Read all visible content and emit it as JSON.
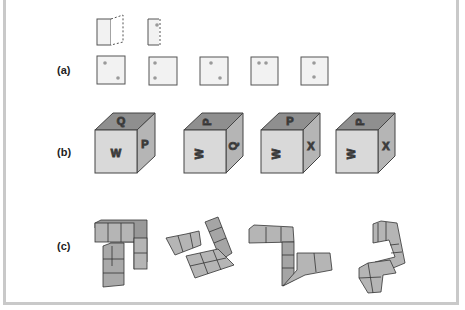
{
  "figure": {
    "rows": [
      {
        "label": "(a)",
        "description": "Unfolding flap and five squares with dot patterns"
      },
      {
        "label": "(b)",
        "description": "Four labeled cubes"
      },
      {
        "label": "(c)",
        "description": "Four unit-cube assemblies"
      }
    ],
    "row_a": {
      "fold_items": [
        "folded-flap",
        "half-square-with-dot"
      ],
      "squares": [
        {
          "dots": "diagonal-top-left-bottom-right"
        },
        {
          "dots": "vertical-left"
        },
        {
          "dots": "diagonal-top-left-bottom-right"
        },
        {
          "dots": "horizontal-top"
        },
        {
          "dots": "vertical-center"
        }
      ]
    },
    "row_b": {
      "cubes": [
        {
          "top": "Q",
          "front": "W",
          "side": "P",
          "rotation": "upright"
        },
        {
          "top": "P",
          "front": "W",
          "side": "Q",
          "rotation": "rotated"
        },
        {
          "top": "P",
          "front": "W",
          "side": "X",
          "rotation": "rotated"
        },
        {
          "top": "P",
          "front": "W",
          "side": "X",
          "rotation": "rotated"
        }
      ]
    },
    "colors": {
      "face_light": "#d9d9d9",
      "face_mid": "#b5b5b5",
      "face_dark": "#8f8f8f",
      "stroke": "#444444",
      "frame": "#c9c9c9",
      "dot": "#9a9a9a"
    }
  }
}
